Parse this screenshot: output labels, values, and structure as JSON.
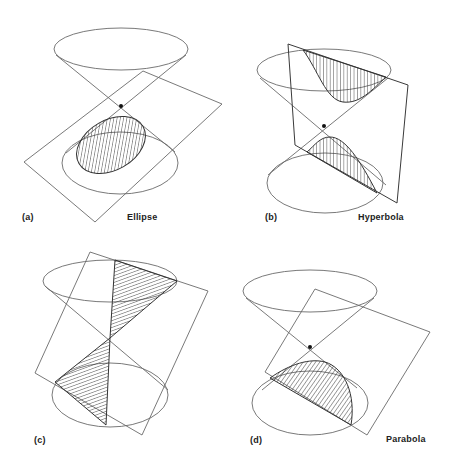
{
  "figure": {
    "panels": [
      {
        "id": "a",
        "tag": "(a)",
        "caption": "Ellipse"
      },
      {
        "id": "b",
        "tag": "(b)",
        "caption": "Hyperbola"
      },
      {
        "id": "c",
        "tag": "(c)",
        "caption": ""
      },
      {
        "id": "d",
        "tag": "(d)",
        "caption": "Parabola"
      }
    ]
  },
  "colors": {
    "line": "#6a6a6a",
    "hatch": "#3a3a3a",
    "apex": "#111111",
    "background": "#ffffff"
  }
}
